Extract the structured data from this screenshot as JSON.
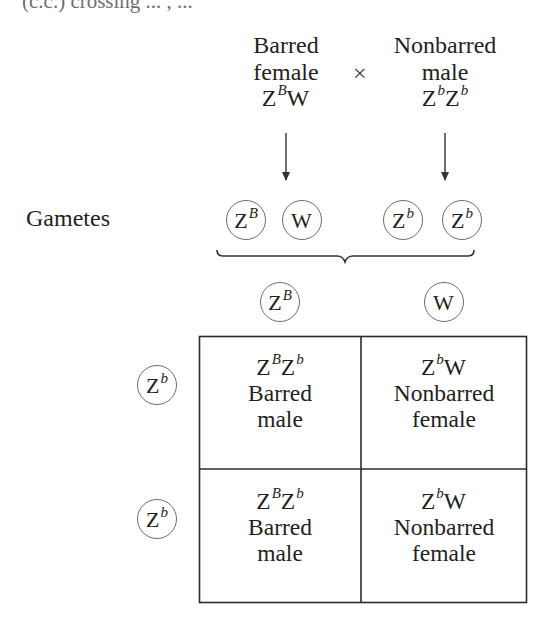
{
  "clipped_top_text": "(c.c.) crossing ... , ...",
  "parents": {
    "female": {
      "phenotype_line1": "Barred",
      "phenotype_line2": "female",
      "genotype_base1": "Z",
      "genotype_sup1": "B",
      "genotype_base2": "W",
      "genotype_sup2": ""
    },
    "cross_symbol": "×",
    "male": {
      "phenotype_line1": "Nonbarred",
      "phenotype_line2": "male",
      "genotype_base1": "Z",
      "genotype_sup1": "b",
      "genotype_base2": "Z",
      "genotype_sup2": "b"
    }
  },
  "gametes_label": "Gametes",
  "gametes": [
    {
      "base": "Z",
      "sup": "B"
    },
    {
      "base": "W",
      "sup": ""
    },
    {
      "base": "Z",
      "sup": "b"
    },
    {
      "base": "Z",
      "sup": "b"
    }
  ],
  "punnett": {
    "column_headers": [
      {
        "base": "Z",
        "sup": "B"
      },
      {
        "base": "W",
        "sup": ""
      }
    ],
    "row_headers": [
      {
        "base": "Z",
        "sup": "b"
      },
      {
        "base": "Z",
        "sup": "b"
      }
    ],
    "cells": [
      [
        {
          "g1": "Z",
          "s1": "B",
          "g2": "Z",
          "s2": "b",
          "line1": "Barred",
          "line2": "male"
        },
        {
          "g1": "Z",
          "s1": "b",
          "g2": "W",
          "s2": "",
          "line1": "Nonbarred",
          "line2": "female"
        }
      ],
      [
        {
          "g1": "Z",
          "s1": "B",
          "g2": "Z",
          "s2": "b",
          "line1": "Barred",
          "line2": "male"
        },
        {
          "g1": "Z",
          "s1": "b",
          "g2": "W",
          "s2": "",
          "line1": "Nonbarred",
          "line2": "female"
        }
      ]
    ]
  },
  "colors": {
    "text": "#231f20",
    "lines": "#333333",
    "circle_stroke": "#6d6d6d",
    "background": "#ffffff"
  }
}
